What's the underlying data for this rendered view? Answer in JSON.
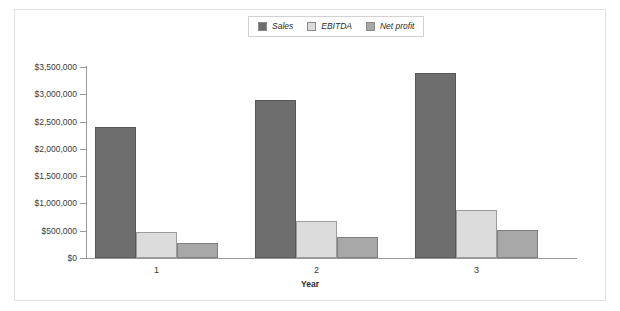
{
  "chart_data": {
    "type": "bar",
    "title": "",
    "xlabel": "Year",
    "ylabel": "",
    "categories": [
      "1",
      "2",
      "3"
    ],
    "series": [
      {
        "name": "Sales",
        "values": [
          2400000,
          2890000,
          3390000
        ],
        "color": "#6e6e6e"
      },
      {
        "name": "EBITDA",
        "values": [
          480000,
          670000,
          880000
        ],
        "color": "#dcdcdc"
      },
      {
        "name": "Net profit",
        "values": [
          270000,
          380000,
          520000
        ],
        "color": "#a8a8a8"
      }
    ],
    "ylim": [
      0,
      3500000
    ],
    "y_ticks": [
      0,
      500000,
      1000000,
      1500000,
      2000000,
      2500000,
      3000000,
      3500000
    ],
    "y_tick_labels": [
      "$0",
      "$500,000",
      "$1,000,000",
      "$1,500,000",
      "$2,000,000",
      "$2,500,000",
      "$3,000,000",
      "$3,500,000"
    ],
    "grid": false,
    "legend_position": "top-center"
  },
  "legend": {
    "items": [
      {
        "label": "Sales",
        "swatch": "#6e6e6e"
      },
      {
        "label": "EBITDA",
        "swatch": "#dcdcdc"
      },
      {
        "label": "Net profit",
        "swatch": "#a8a8a8"
      }
    ]
  },
  "axes": {
    "x_title": "Year"
  }
}
